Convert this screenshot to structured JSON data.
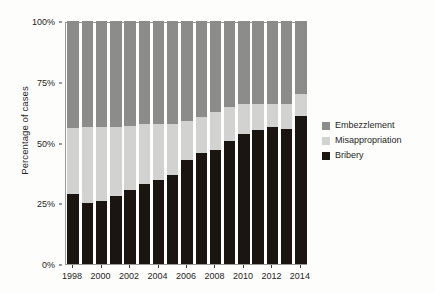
{
  "chart_data": {
    "type": "bar",
    "stacked": true,
    "stack_mode": "percent",
    "title": "",
    "subtitle": "",
    "xlabel": "",
    "ylabel": "Percentage of cases",
    "ylim": [
      0,
      100
    ],
    "yticks": [
      0,
      25,
      50,
      75,
      100
    ],
    "ytick_labels": [
      "0%",
      "25%",
      "50%",
      "75%",
      "100%"
    ],
    "xlim": [
      1997.5,
      2014.5
    ],
    "xticks": [
      1998,
      2000,
      2002,
      2004,
      2006,
      2008,
      2010,
      2012,
      2014
    ],
    "xtick_labels": [
      "1998",
      "2000",
      "2002",
      "2004",
      "2006",
      "2008",
      "2010",
      "2012",
      "2014"
    ],
    "grid": false,
    "legend_position": "right",
    "categories": [
      1998,
      1999,
      2000,
      2001,
      2002,
      2003,
      2004,
      2005,
      2006,
      2007,
      2008,
      2009,
      2010,
      2011,
      2012,
      2013,
      2014
    ],
    "series": [
      {
        "name": "Bribery",
        "color": "#1a1510",
        "stack_order": 0,
        "values": [
          29,
          25,
          26,
          28,
          30.5,
          33,
          34.5,
          36.5,
          43,
          45.5,
          47,
          50.5,
          53.5,
          55,
          56.5,
          55.5,
          61
        ]
      },
      {
        "name": "Misappropriation",
        "color": "#d2d2d0",
        "stack_order": 1,
        "values": [
          27,
          31.5,
          30.5,
          28.5,
          26.5,
          24.5,
          23,
          21,
          16,
          15,
          15.5,
          14,
          12.5,
          11,
          9.5,
          10.5,
          9
        ]
      },
      {
        "name": "Embezzlement",
        "color": "#8c8c8a",
        "stack_order": 2,
        "values": [
          44,
          43.5,
          43.5,
          43.5,
          43,
          42.5,
          42.5,
          42.5,
          41,
          39.5,
          37.5,
          35.5,
          34,
          34,
          34,
          34,
          30
        ]
      }
    ]
  },
  "legend": {
    "items": [
      {
        "label": "Embezzlement",
        "color": "#8c8c8a"
      },
      {
        "label": "Misappropriation",
        "color": "#d2d2d0"
      },
      {
        "label": "Bribery",
        "color": "#1a1510"
      }
    ]
  },
  "axes": {
    "y_title": "Percentage of cases"
  },
  "colors": {
    "embezzlement": "#8c8c8a",
    "misappropriation": "#d2d2d0",
    "bribery": "#1a1510",
    "frame": "#9a9a95",
    "background": "#fdfdfb",
    "plot_background": "#ffffff",
    "text": "#1f1f1f"
  }
}
